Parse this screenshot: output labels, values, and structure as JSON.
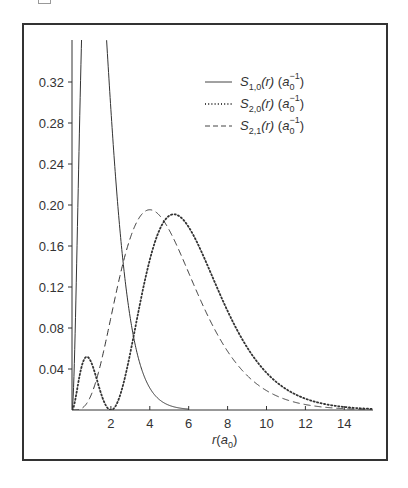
{
  "chart_data": {
    "type": "line",
    "title": "",
    "xlabel": "r(a0)",
    "ylabel": "",
    "xlim": [
      0,
      15.4
    ],
    "ylim": [
      0,
      0.36
    ],
    "grid": false,
    "legend_position": "upper right",
    "x_ticks": [
      "2",
      "4",
      "6",
      "8",
      "10",
      "12",
      "14"
    ],
    "y_ticks": [
      "0.04",
      "0.08",
      "0.12",
      "0.16",
      "0.20",
      "0.24",
      "0.28",
      "0.32"
    ],
    "x": [
      0,
      0.5,
      1,
      1.5,
      2,
      2.5,
      3,
      3.5,
      4,
      4.5,
      5,
      5.5,
      6,
      7,
      8,
      9,
      10,
      11,
      12,
      13,
      14,
      15
    ],
    "series": [
      {
        "name": "S1,0(r) (a0^-1)",
        "style": "solid",
        "values": [
          0,
          0.368,
          0.541,
          0.448,
          0.293,
          0.168,
          0.089,
          0.045,
          0.021,
          0.01,
          0.005,
          0.002,
          0.001,
          0.0,
          0.0,
          0.0,
          0.0,
          0.0,
          0.0,
          0.0,
          0.0,
          0.0
        ],
        "note": "peak 0.541 at r=1 is clipped above the plot top"
      },
      {
        "name": "S2,0(r) (a0^-1)",
        "style": "dotted",
        "values": [
          0,
          0.043,
          0.046,
          0.006,
          0,
          0.016,
          0.056,
          0.102,
          0.147,
          0.178,
          0.189,
          0.185,
          0.179,
          0.142,
          0.101,
          0.066,
          0.041,
          0.024,
          0.013,
          0.007,
          0.004,
          0.002
        ]
      },
      {
        "name": "S2,1(r) (a0^-1)",
        "style": "dashed",
        "values": [
          0,
          0.002,
          0.015,
          0.047,
          0.09,
          0.134,
          0.168,
          0.189,
          0.195,
          0.189,
          0.175,
          0.155,
          0.134,
          0.091,
          0.057,
          0.034,
          0.019,
          0.01,
          0.005,
          0.003,
          0.001,
          0.001
        ]
      }
    ]
  },
  "legend": {
    "items": [
      {
        "symbol": "S",
        "sub": "1,0",
        "arg": "(r)",
        "unit_base": "a",
        "unit_sub": "0",
        "unit_sup": "−1",
        "style": "solid"
      },
      {
        "symbol": "S",
        "sub": "2,0",
        "arg": "(r)",
        "unit_base": "a",
        "unit_sub": "0",
        "unit_sup": "−1",
        "style": "dotted"
      },
      {
        "symbol": "S",
        "sub": "2,1",
        "arg": "(r)",
        "unit_base": "a",
        "unit_sub": "0",
        "unit_sup": "−1",
        "style": "dashed"
      }
    ]
  },
  "axes": {
    "x_label_base": "r",
    "x_label_unit": "a",
    "x_label_unit_sub": "0"
  }
}
